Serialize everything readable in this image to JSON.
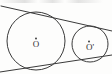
{
  "figure": {
    "kind": "geometry-diagram",
    "background_color": "#fdfdfc",
    "stroke_color": "#3a3a3a",
    "label_color": "#2e2e2e",
    "canvas": {
      "width": 112,
      "height": 74
    },
    "circles": [
      {
        "id": "large-circle",
        "label": "O",
        "center_x": 36,
        "center_y": 41,
        "radius": 29,
        "center_dot_radius": 0.9,
        "label_offset_y": 7
      },
      {
        "id": "small-circle",
        "label": "O'",
        "center_x": 90,
        "center_y": 44,
        "radius": 18,
        "center_dot_radius": 0.9,
        "label_offset_y": 7
      }
    ],
    "tangents": [
      {
        "id": "upper-tangent",
        "x1": 1,
        "y1": 6,
        "x2": 112,
        "y2": 31
      },
      {
        "id": "lower-tangent",
        "x1": 0,
        "y1": 72,
        "x2": 112,
        "y2": 55
      }
    ],
    "top_edge_text_fragment": ""
  }
}
